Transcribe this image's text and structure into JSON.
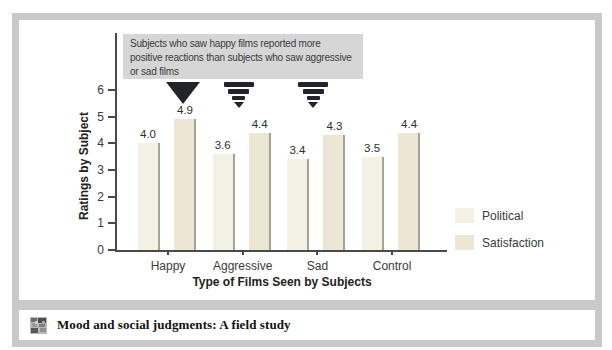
{
  "colors": {
    "frame_gray": "#c9c9c9",
    "annotation_bg": "#d6d6d6",
    "political_bar": "#f3f0e4",
    "satisfaction_bar": "#ece7d5",
    "bar_shadow": "#a8a296",
    "arrow_dark": "#23232c",
    "axis": "#4a4a4a",
    "text": "#333333"
  },
  "chart_data": {
    "type": "bar",
    "categories": [
      "Happy",
      "Aggressive",
      "Sad",
      "Control"
    ],
    "series": [
      {
        "name": "Political",
        "values": [
          4.0,
          3.6,
          3.4,
          3.5
        ]
      },
      {
        "name": "Satisfaction",
        "values": [
          4.9,
          4.4,
          4.3,
          4.4
        ]
      }
    ],
    "xlabel": "Type of Films Seen by Subjects",
    "ylabel": "Ratings by Subject",
    "ylim": [
      0,
      6
    ],
    "yticks": [
      0,
      1,
      2,
      3,
      4,
      5,
      6
    ],
    "grid": false,
    "value_labels": true,
    "legend_position": "right",
    "callout": {
      "text": "Subjects who saw happy films reported more\npositive reactions than subjects who saw aggressive\nor sad films"
    },
    "arrows": [
      {
        "style": "solid",
        "category": "Happy"
      },
      {
        "style": "striped",
        "category": "Aggressive"
      },
      {
        "style": "striped",
        "category": "Sad"
      }
    ]
  },
  "caption": {
    "title": "Mood and social judgments: A field study"
  }
}
